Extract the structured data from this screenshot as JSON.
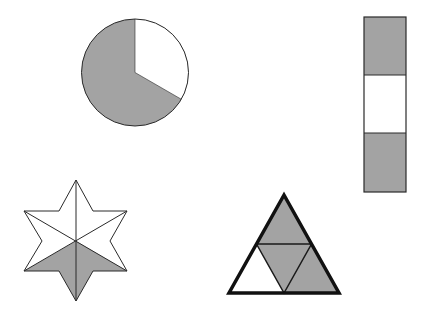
{
  "diagram": {
    "colors": {
      "shade": "#a3a3a3",
      "background": "#ffffff",
      "stroke": "#2a2a2a"
    },
    "shapes": [
      {
        "id": "circle",
        "kind": "circle",
        "parts": 3,
        "shaded_parts": 2,
        "fraction_shaded": "2/3"
      },
      {
        "id": "rectangle",
        "kind": "vertical-rectangle",
        "parts": 3,
        "shaded_parts": 2,
        "fraction_shaded": "2/3"
      },
      {
        "id": "star",
        "kind": "six-point-star",
        "parts": 6,
        "shaded_parts": 2,
        "fraction_shaded": "2/6"
      },
      {
        "id": "triangle",
        "kind": "triangle",
        "parts": 4,
        "shaded_parts": 3,
        "fraction_shaded": "3/4"
      }
    ]
  }
}
